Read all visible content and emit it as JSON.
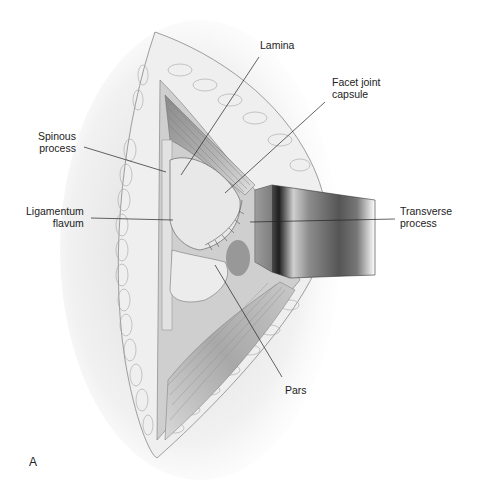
{
  "figure": {
    "panel_label": "A",
    "labels": {
      "lamina": "Lamina",
      "facet_joint_capsule": "Facet joint\ncapsule",
      "spinous_process": "Spinous\nprocess",
      "ligamentum_flavum": "Ligamentum\nflavum",
      "transverse_process": "Transverse\nprocess",
      "pars": "Pars"
    },
    "colors": {
      "background": "#ffffff",
      "line": "#222222",
      "tissue": "#d9d9d9",
      "retractor_dark": "#2a2a2a"
    }
  }
}
